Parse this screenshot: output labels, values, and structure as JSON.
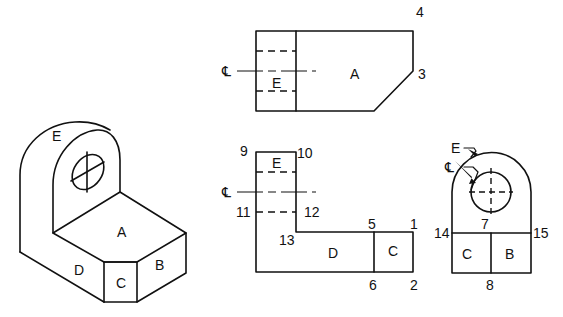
{
  "isometric_view": {
    "faces": {
      "A": "A",
      "B": "B",
      "C": "C",
      "D": "D",
      "E": "E"
    }
  },
  "top_view": {
    "faces": {
      "A": "A",
      "E": "E"
    },
    "centerline_symbol": "℄",
    "points": {
      "p4": "4",
      "p3": "3"
    }
  },
  "front_view": {
    "faces": {
      "E": "E",
      "D": "D",
      "C": "C"
    },
    "centerline_symbol": "℄",
    "points": {
      "p9": "9",
      "p10": "10",
      "p11": "11",
      "p12": "12",
      "p13": "13",
      "p5": "5",
      "p1": "1",
      "p6": "6",
      "p2": "2"
    }
  },
  "side_view": {
    "faces": {
      "C": "C",
      "B": "B"
    },
    "leader_labels": {
      "E": "E",
      "centerline": "℄"
    },
    "points": {
      "p7": "7",
      "p14": "14",
      "p15": "15",
      "p8": "8"
    }
  },
  "colors": {
    "line": "#111111",
    "background": "#ffffff"
  }
}
